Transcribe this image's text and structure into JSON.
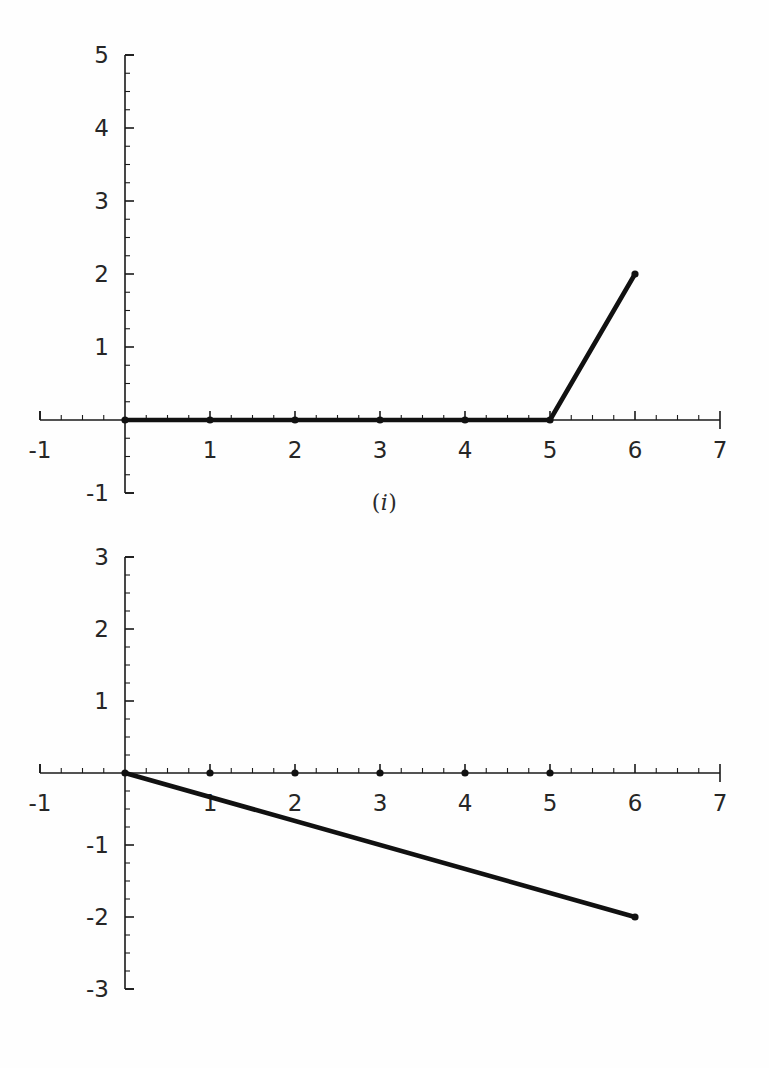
{
  "document": {
    "background_color": "#fefefe",
    "ink_color": "#111111"
  },
  "figures": [
    {
      "caption": "(i)",
      "caption_open": "(",
      "caption_roman": "i",
      "caption_close": ")"
    },
    {
      "caption": "(ii)",
      "caption_open": "(",
      "caption_roman": "ii",
      "caption_close": ")"
    }
  ],
  "chart_data": [
    {
      "type": "line",
      "title": "(i)",
      "xlabel": "",
      "ylabel": "",
      "xlim": [
        -1,
        7
      ],
      "ylim": [
        -1,
        5
      ],
      "grid": false,
      "legend": "none",
      "x_ticks": [
        -1,
        1,
        2,
        3,
        4,
        5,
        6,
        7
      ],
      "x_tick_labels": [
        "-1",
        "1",
        "2",
        "3",
        "4",
        "5",
        "6",
        "7"
      ],
      "x_minor_tick_step": 0.25,
      "y_ticks": [
        -1,
        1,
        2,
        3,
        4,
        5
      ],
      "y_tick_labels": [
        "-1",
        "1",
        "2",
        "3",
        "4",
        "5"
      ],
      "y_minor_tick_step": 0.25,
      "series": [
        {
          "name": "piecewise ramp",
          "x": [
            0,
            1,
            2,
            3,
            4,
            5,
            6
          ],
          "y": [
            0,
            0,
            0,
            0,
            0,
            0,
            2
          ],
          "markers": true,
          "marker_x": [
            0,
            1,
            2,
            3,
            4,
            5,
            6
          ],
          "marker_y": [
            0,
            0,
            0,
            0,
            0,
            0,
            2
          ]
        }
      ],
      "annotations": [
        "flat at y=0 for 0<=x<=5, then linear rise to (6,2)"
      ]
    },
    {
      "type": "line",
      "title": "(ii)",
      "xlabel": "",
      "ylabel": "",
      "xlim": [
        -1,
        7
      ],
      "ylim": [
        -3,
        3
      ],
      "grid": false,
      "legend": "none",
      "x_ticks": [
        -1,
        1,
        2,
        3,
        4,
        5,
        6,
        7
      ],
      "x_tick_labels": [
        "-1",
        "1",
        "2",
        "3",
        "4",
        "5",
        "6",
        "7"
      ],
      "x_minor_tick_step": 0.25,
      "y_ticks": [
        -3,
        -2,
        -1,
        1,
        2,
        3
      ],
      "y_tick_labels": [
        "-3",
        "-2",
        "-1",
        "1",
        "2",
        "3"
      ],
      "y_minor_tick_step": 0.25,
      "series": [
        {
          "name": "descending line",
          "x": [
            0,
            6
          ],
          "y": [
            0,
            -2
          ],
          "markers": true,
          "marker_x": [
            0,
            1,
            2,
            3,
            4,
            5,
            6
          ],
          "marker_y": [
            0,
            0,
            0,
            0,
            0,
            0,
            -2
          ]
        }
      ],
      "annotations": [
        "straight line from (0,0) to (6,-2); dots shown on the x-axis at integers 0..5"
      ]
    }
  ]
}
